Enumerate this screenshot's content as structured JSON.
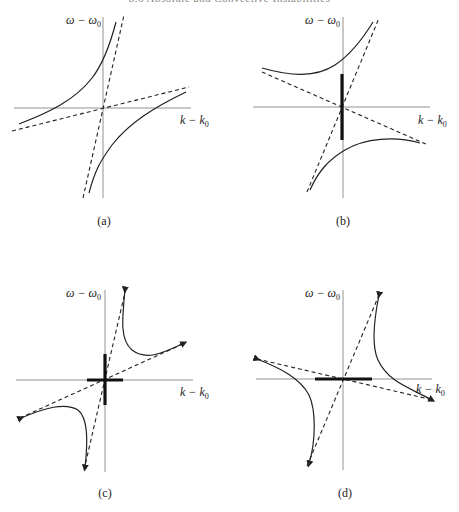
{
  "running_head": "8.6 Absolute and Convective Instabilities",
  "axes": {
    "y_label": "ω − ω",
    "y_label_sub": "0",
    "x_label": "k − k",
    "x_label_sub": "0"
  },
  "panels": [
    {
      "id": "a",
      "caption": "(a)",
      "description": "Two hyperbolic branches, asymptotes with positive slopes; no thick segment (stable)"
    },
    {
      "id": "b",
      "caption": "(b)",
      "description": "Branches above and below, asymptotes of opposite slope; thick vertical segment on ω axis"
    },
    {
      "id": "c",
      "caption": "(c)",
      "description": "Branches with arrows, asymptotes positive slopes; thick cross at origin"
    },
    {
      "id": "d",
      "caption": "(d)",
      "description": "Branches with arrows, asymptotes of opposite slope; thick horizontal segment on k axis"
    }
  ],
  "colors": {
    "axis": "#777777",
    "curve": "#222222",
    "thick": "#111111"
  }
}
